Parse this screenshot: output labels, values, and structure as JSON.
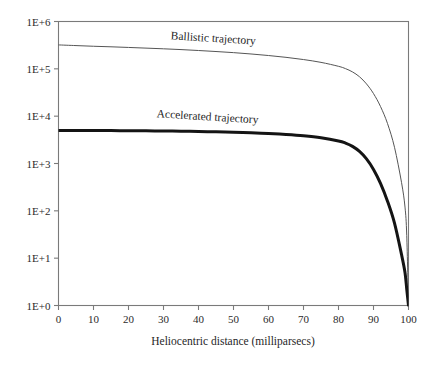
{
  "chart_data": {
    "type": "line",
    "title": "",
    "subtitle": "",
    "xlabel": "Heliocentric distance (milliparsecs)",
    "ylabel": "",
    "yscale": "log",
    "xscale": "linear",
    "xlim": [
      0,
      100
    ],
    "ylim": [
      1,
      1000000
    ],
    "grid": false,
    "legend_position": "inline-curve-labels",
    "xticks": [
      0,
      10,
      20,
      30,
      40,
      50,
      60,
      70,
      80,
      90,
      100
    ],
    "xticklabels": [
      "0",
      "10",
      "20",
      "30",
      "40",
      "50",
      "60",
      "70",
      "80",
      "90",
      "100"
    ],
    "yticks": [
      1,
      10,
      100,
      1000,
      10000,
      100000,
      1000000
    ],
    "yticklabels": [
      "1E+0",
      "1E+1",
      "1E+2",
      "1E+3",
      "1E+4",
      "1E+5",
      "1E+6"
    ],
    "x": [
      0,
      5,
      10,
      15,
      20,
      25,
      30,
      35,
      40,
      45,
      50,
      55,
      60,
      65,
      70,
      75,
      80,
      82,
      84,
      86,
      88,
      90,
      92,
      94,
      96,
      98,
      99,
      99.5,
      100
    ],
    "series": [
      {
        "name": "Ballistic trajectory",
        "label": "Ballistic trajectory",
        "color": "#555555",
        "linewidth": 1,
        "values": [
          320000,
          310000,
          300000,
          292000,
          283000,
          274000,
          265000,
          255000,
          244000,
          232000,
          220000,
          206000,
          191000,
          175000,
          157000,
          137000,
          113000,
          101000,
          86000,
          68000,
          48000,
          30000,
          16000,
          7000,
          2200,
          400,
          120,
          30,
          1
        ]
      },
      {
        "name": "Accelerated trajectory",
        "label": "Accelerated trajectory",
        "color": "#141414",
        "linewidth": 3,
        "values": [
          5000,
          4990,
          4975,
          4955,
          4930,
          4900,
          4860,
          4810,
          4750,
          4670,
          4570,
          4450,
          4300,
          4100,
          3850,
          3500,
          3000,
          2700,
          2300,
          1800,
          1250,
          750,
          380,
          160,
          55,
          12,
          5,
          2.2,
          1
        ]
      }
    ],
    "annotations": [
      {
        "text": "Ballistic trajectory",
        "x": 32,
        "y": 420000,
        "rotation": 3.5
      },
      {
        "text": "Accelerated trajectory",
        "x": 28,
        "y": 9500,
        "rotation": 3.5
      }
    ]
  },
  "axes": {
    "x_axis_title": "Heliocentric distance (milliparsecs)",
    "y_axis_title": ""
  },
  "style": {
    "background": "#ffffff",
    "frame_color": "#7a7a7a",
    "tick_color": "#7a7a7a",
    "text_color": "#1f1f1f",
    "ballistic_color": "#555555",
    "accelerated_color": "#141414"
  }
}
